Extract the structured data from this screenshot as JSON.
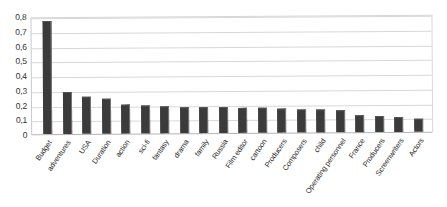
{
  "chart_data": {
    "type": "bar",
    "title": "",
    "subtitle": "",
    "xlabel": "",
    "ylabel": "",
    "ylim": [
      0,
      0.8
    ],
    "grid": true,
    "legend": "none",
    "decimal_separator": ",",
    "y_ticks": [
      "0",
      "0,1",
      "0,2",
      "0,3",
      "0,4",
      "0,5",
      "0,6",
      "0,7",
      "0,8"
    ],
    "y_tick_values": [
      0,
      0.1,
      0.2,
      0.3,
      0.4,
      0.5,
      0.6,
      0.7,
      0.8
    ],
    "categories": [
      "Budget",
      "adventures",
      "USA",
      "Duration",
      "action",
      "sci-fi",
      "fantasy",
      "drama",
      "family",
      "Russia",
      "Film editor",
      "cartoon",
      "Producers",
      "Composers",
      "child",
      "Operating personnel",
      "France",
      "Producers",
      "Screenwriters",
      "Actors"
    ],
    "values": [
      0.77,
      0.29,
      0.255,
      0.24,
      0.195,
      0.19,
      0.185,
      0.18,
      0.175,
      0.175,
      0.17,
      0.17,
      0.165,
      0.16,
      0.155,
      0.15,
      0.115,
      0.11,
      0.105,
      0.09
    ],
    "series": [
      {
        "name": "",
        "values": [
          0.77,
          0.29,
          0.255,
          0.24,
          0.195,
          0.19,
          0.185,
          0.18,
          0.175,
          0.175,
          0.17,
          0.17,
          0.165,
          0.16,
          0.155,
          0.15,
          0.115,
          0.11,
          0.105,
          0.09
        ]
      }
    ],
    "colors": {
      "bar": "#3b3b3b",
      "bar_edge": "#777777",
      "gridline": "#d8d8d8",
      "axis": "#b4b4b4",
      "text": "#2b2b2b",
      "background": "#ffffff"
    }
  }
}
